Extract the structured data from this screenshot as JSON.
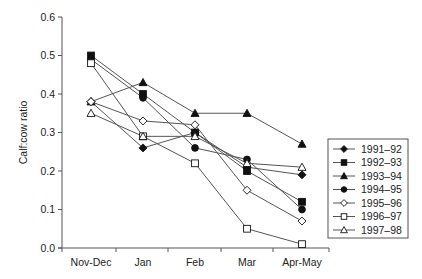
{
  "chart_data": {
    "type": "line",
    "title": "",
    "xlabel": "",
    "ylabel": "Calf:cow ratio",
    "ylim": [
      0.0,
      0.6
    ],
    "yticks": [
      "0.0",
      "0.1",
      "0.2",
      "0.3",
      "0.4",
      "0.5",
      "0.6"
    ],
    "grid": false,
    "legend_position": "right",
    "categories": [
      "Nov-Dec",
      "Jan",
      "Feb",
      "Mar",
      "Apr-May"
    ],
    "series": [
      {
        "name": "1991–92",
        "marker": "filled-diamond",
        "values": [
          0.38,
          0.26,
          0.3,
          0.21,
          0.19
        ]
      },
      {
        "name": "1992–93",
        "marker": "filled-square",
        "values": [
          0.5,
          0.4,
          0.3,
          0.2,
          0.12
        ]
      },
      {
        "name": "1993–94",
        "marker": "filled-triangle",
        "values": [
          0.38,
          0.43,
          0.35,
          0.35,
          0.27
        ]
      },
      {
        "name": "1994–95",
        "marker": "filled-circle",
        "values": [
          0.49,
          0.39,
          0.26,
          0.23,
          0.1
        ]
      },
      {
        "name": "1995–96",
        "marker": "open-diamond",
        "values": [
          0.38,
          0.33,
          0.32,
          0.15,
          0.07
        ]
      },
      {
        "name": "1996–97",
        "marker": "open-square",
        "values": [
          0.48,
          0.29,
          0.22,
          0.05,
          0.01
        ]
      },
      {
        "name": "1997–98",
        "marker": "open-triangle",
        "values": [
          0.35,
          0.29,
          0.29,
          0.22,
          0.21
        ]
      }
    ]
  },
  "colors": {
    "line": "#555555",
    "marker": "#111111",
    "axis": "#555555",
    "text": "#222222"
  }
}
